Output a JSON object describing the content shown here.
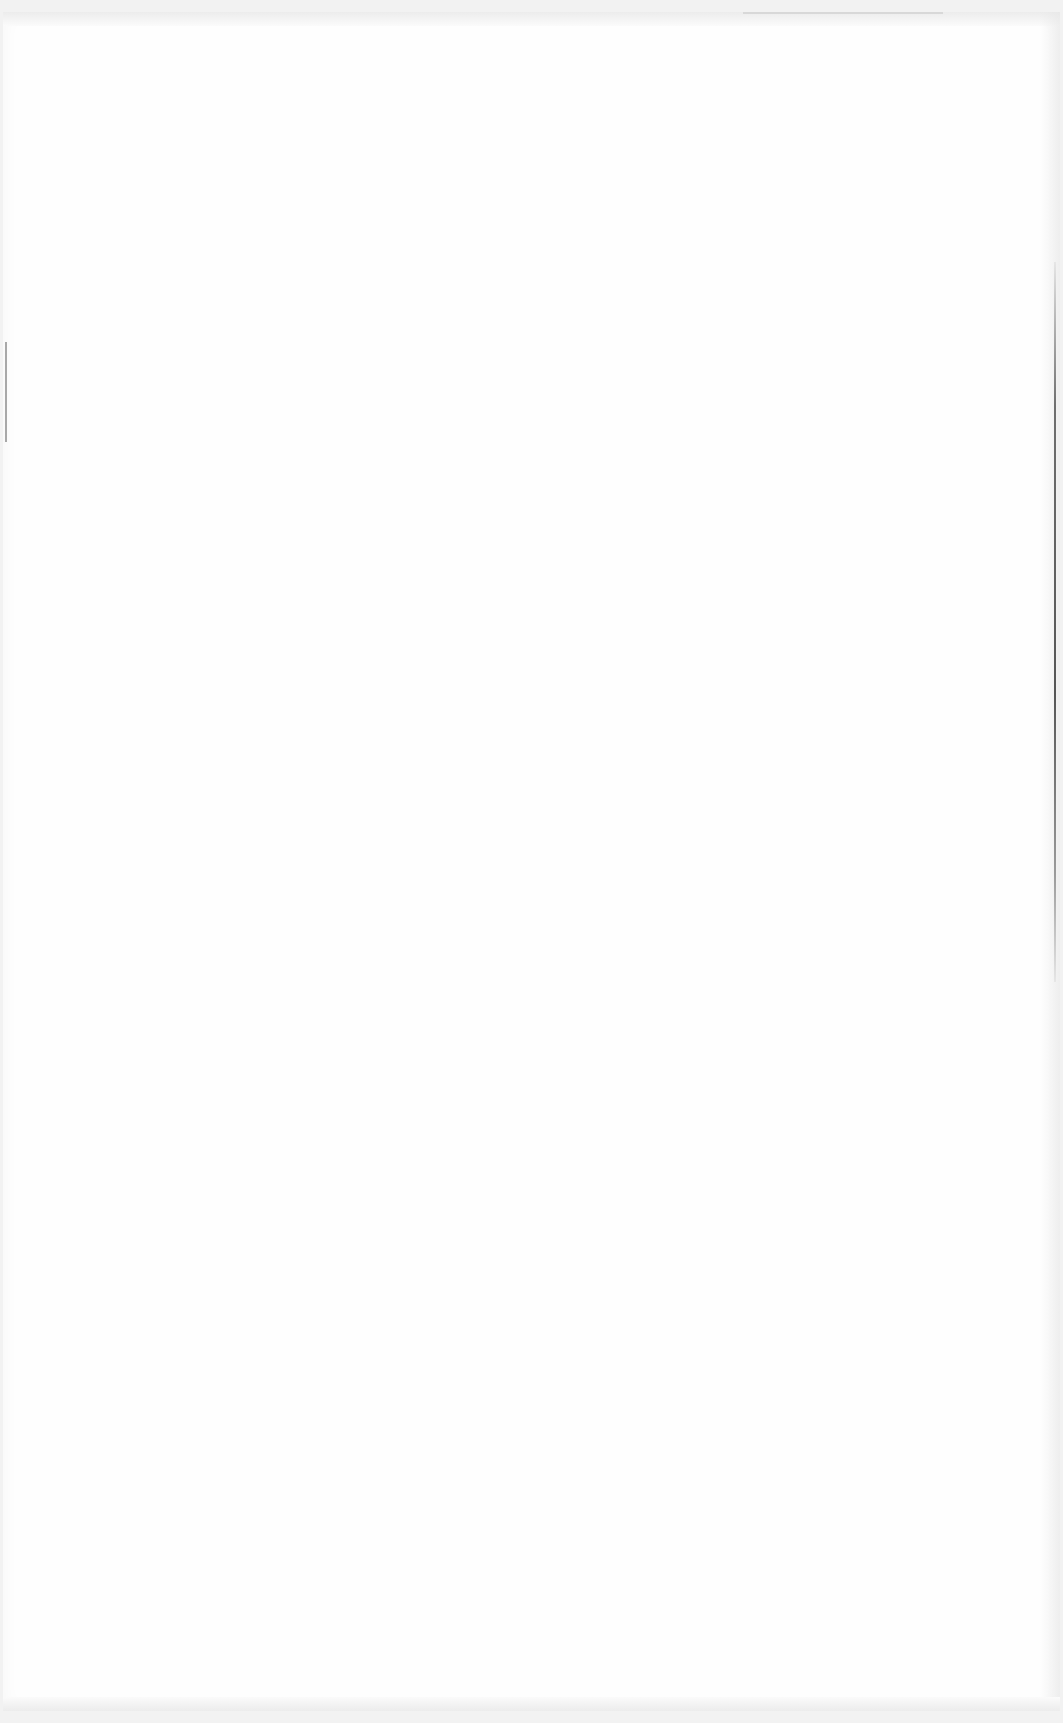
{
  "page": {
    "type": "blank-document-page",
    "background_color": "#ffffff",
    "border_color": "#f2f2f2",
    "edge_line_color": "#555555",
    "visible_text": ""
  }
}
